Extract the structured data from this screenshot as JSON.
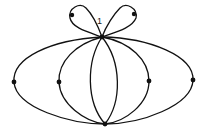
{
  "diagram": {
    "type": "graph",
    "vertex_label": "1",
    "colors": {
      "stroke": "#111111",
      "background": "#ffffff"
    },
    "vertices": [
      {
        "id": "top",
        "x": 102,
        "y": 37,
        "label": "1"
      },
      {
        "id": "bottom",
        "x": 105,
        "y": 124
      },
      {
        "id": "left-outer",
        "x": 14,
        "y": 82
      },
      {
        "id": "left-inner",
        "x": 59,
        "y": 82
      },
      {
        "id": "right-inner",
        "x": 149,
        "y": 81
      },
      {
        "id": "right-outer",
        "x": 193,
        "y": 80
      },
      {
        "id": "loop-left",
        "x": 72,
        "y": 15
      },
      {
        "id": "loop-right",
        "x": 134,
        "y": 14
      }
    ],
    "edges": [
      {
        "from": "top",
        "to": "left-outer"
      },
      {
        "from": "left-outer",
        "to": "bottom"
      },
      {
        "from": "top",
        "to": "left-inner"
      },
      {
        "from": "left-inner",
        "to": "bottom"
      },
      {
        "from": "top",
        "to": "bottom",
        "side": "left"
      },
      {
        "from": "top",
        "to": "bottom",
        "side": "right"
      },
      {
        "from": "top",
        "to": "right-inner"
      },
      {
        "from": "right-inner",
        "to": "bottom"
      },
      {
        "from": "top",
        "to": "right-outer"
      },
      {
        "from": "right-outer",
        "to": "bottom"
      },
      {
        "from": "top",
        "to": "loop-left",
        "loop": true
      },
      {
        "from": "top",
        "to": "loop-right",
        "loop": true
      }
    ]
  }
}
